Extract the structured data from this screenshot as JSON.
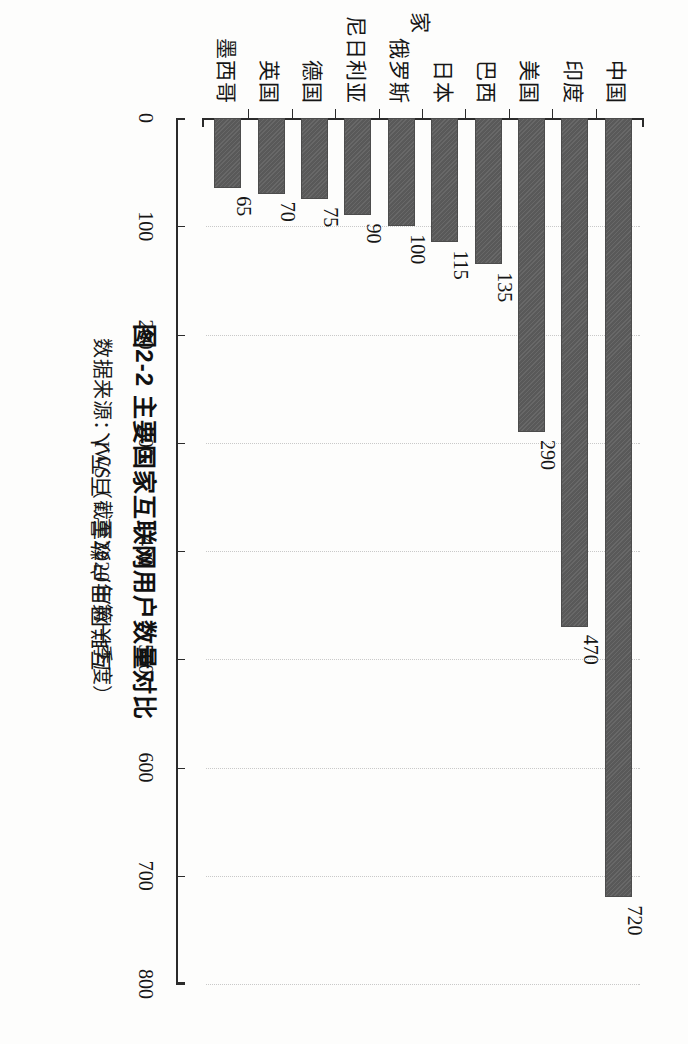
{
  "figure": {
    "title": "图2-2  主要国家互联网用户数量对比",
    "source": "数据来源：IWS（截至2020年第一季度）"
  },
  "chart_data": {
    "type": "bar",
    "orientation": "horizontal",
    "title": "图2-2  主要国家互联网用户数量对比",
    "subtitle": "数据来源：IWS（截至2020年第一季度）",
    "xlabel": "国 家",
    "ylabel": "互联网用户数量 / 百万人",
    "categories": [
      "中国",
      "印度",
      "美国",
      "巴西",
      "日本",
      "俄罗斯",
      "尼日利亚",
      "德国",
      "英国",
      "墨西哥"
    ],
    "values": [
      720,
      470,
      290,
      135,
      115,
      100,
      90,
      75,
      70,
      65
    ],
    "data_labels": [
      "720",
      "470",
      "290",
      "135",
      "115",
      "100",
      "90",
      "75",
      "70",
      "65"
    ],
    "ylim": [
      0,
      800
    ],
    "tick_values": [
      0,
      100,
      200,
      300,
      400,
      500,
      600,
      700,
      800
    ],
    "tick_labels": [
      "0",
      "100",
      "200",
      "300",
      "400",
      "500",
      "600",
      "700",
      "800"
    ],
    "grid": true,
    "legend": false,
    "bar_color": "#595959",
    "axis_color": "#2b2b2b",
    "grid_color": "#c9c9c9",
    "units": "百万人"
  }
}
